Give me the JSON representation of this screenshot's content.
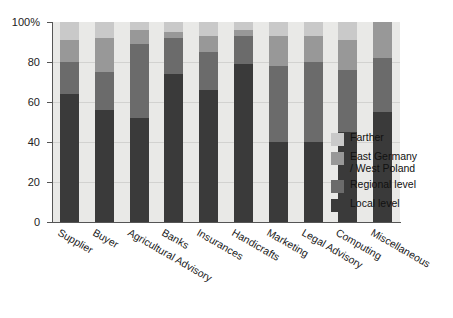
{
  "chart_data": {
    "type": "bar",
    "subtype": "stacked-percent",
    "title": "",
    "xlabel": "",
    "ylabel": "",
    "ylim": [
      0,
      100
    ],
    "ytick_labels": [
      "0",
      "20",
      "40",
      "60",
      "80",
      "100%"
    ],
    "ytick_values": [
      0,
      20,
      40,
      60,
      80,
      100
    ],
    "grid": true,
    "legend_position": "right",
    "categories": [
      "Supplier",
      "Buyer",
      "Agricultural Advisory",
      "Banks",
      "Insurances",
      "Handicrafts",
      "Marketing",
      "Legal Advisory",
      "Computing",
      "Miscellaneous"
    ],
    "series": [
      {
        "name": "Local level",
        "color": "#3a3a3a",
        "values": [
          64,
          56,
          52,
          74,
          66,
          79,
          40,
          40,
          45,
          55
        ]
      },
      {
        "name": "Regional level",
        "color": "#6b6b6b",
        "values": [
          16,
          19,
          37,
          18,
          19,
          14,
          38,
          40,
          31,
          27
        ]
      },
      {
        "name": "East Germany / West Poland",
        "color": "#989898",
        "values": [
          11,
          17,
          7,
          3,
          8,
          3,
          15,
          13,
          15,
          18
        ]
      },
      {
        "name": "Farther",
        "color": "#c9c9c9",
        "values": [
          9,
          8,
          4,
          5,
          7,
          4,
          7,
          7,
          9,
          0
        ]
      }
    ],
    "cumulative_tops": {
      "Local level": [
        64,
        56,
        52,
        74,
        66,
        79,
        40,
        40,
        45,
        55
      ],
      "Regional level": [
        80,
        75,
        89,
        92,
        85,
        93,
        78,
        80,
        76,
        82
      ],
      "East Germany / West Poland": [
        91,
        92,
        96,
        95,
        93,
        96,
        93,
        93,
        91,
        100
      ],
      "Farther": [
        100,
        100,
        100,
        100,
        100,
        100,
        100,
        100,
        100,
        100
      ]
    }
  },
  "legend": {
    "items": [
      {
        "label": "Farther",
        "color": "#c9c9c9"
      },
      {
        "label": "East Germany\n/ West Poland",
        "color": "#989898"
      },
      {
        "label": "Regional level",
        "color": "#6b6b6b"
      },
      {
        "label": "Local level",
        "color": "#3a3a3a"
      }
    ]
  },
  "colors": {
    "plot_background": "#e9e9e7",
    "gridline": "#d2d2d0",
    "axis": "#555555",
    "page_background": "#ffffff"
  }
}
